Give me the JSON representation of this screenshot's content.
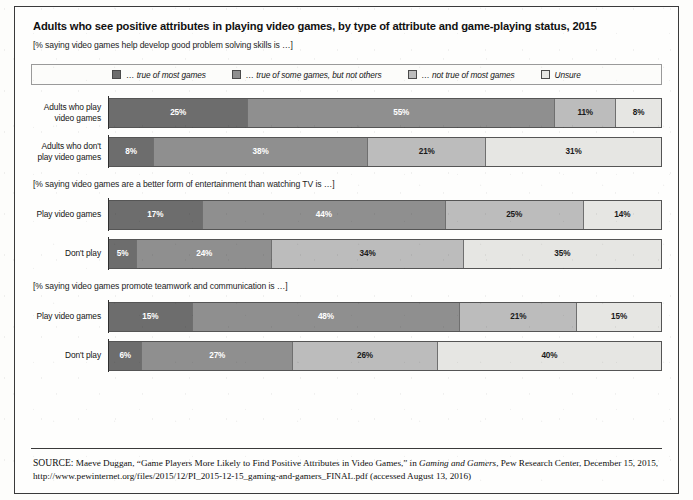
{
  "title": "Adults who see positive attributes in playing video games, by type of attribute and game-playing status, 2015",
  "subtitle": "[% saying video games help develop good problem solving skills is …]",
  "palette": {
    "true_of_most": "#6d6d6d",
    "true_of_some": "#8f8f8f",
    "not_true_of_most": "#bcbcbc",
    "unsure": "#e6e6e3",
    "frame": "#3a3a3a"
  },
  "legend": {
    "items": [
      {
        "label": "… true of most games",
        "color": "#6d6d6d"
      },
      {
        "label": "… true of some games, but not others",
        "color": "#8f8f8f"
      },
      {
        "label": "… not true of most games",
        "color": "#bcbcbc"
      },
      {
        "label": "Unsure",
        "color": "#e6e6e3"
      }
    ]
  },
  "sections": [
    {
      "note": "",
      "note_visible": false,
      "rows": [
        {
          "label_line1": "Adults who play",
          "label_line2": "video games",
          "segments": [
            {
              "value": 25,
              "label": "25%",
              "color": "#6d6d6d",
              "text_color": "#ffffff"
            },
            {
              "value": 55,
              "label": "55%",
              "color": "#8f8f8f",
              "text_color": "#ffffff"
            },
            {
              "value": 11,
              "label": "11%",
              "color": "#bcbcbc",
              "text_color": "#1a1a1a"
            },
            {
              "value": 8,
              "label": "8%",
              "color": "#e6e6e3",
              "text_color": "#1a1a1a"
            }
          ]
        },
        {
          "label_line1": "Adults who don't",
          "label_line2": "play video games",
          "segments": [
            {
              "value": 8,
              "label": "8%",
              "color": "#6d6d6d",
              "text_color": "#ffffff"
            },
            {
              "value": 38,
              "label": "38%",
              "color": "#8f8f8f",
              "text_color": "#ffffff"
            },
            {
              "value": 21,
              "label": "21%",
              "color": "#bcbcbc",
              "text_color": "#1a1a1a"
            },
            {
              "value": 31,
              "label": "31%",
              "color": "#e6e6e3",
              "text_color": "#1a1a1a"
            }
          ]
        }
      ]
    },
    {
      "note": "[% saying video games are a better form of entertainment than watching TV is …]",
      "note_visible": true,
      "rows": [
        {
          "label_line1": "Play video games",
          "label_line2": "",
          "segments": [
            {
              "value": 17,
              "label": "17%",
              "color": "#6d6d6d",
              "text_color": "#ffffff"
            },
            {
              "value": 44,
              "label": "44%",
              "color": "#8f8f8f",
              "text_color": "#ffffff"
            },
            {
              "value": 25,
              "label": "25%",
              "color": "#bcbcbc",
              "text_color": "#1a1a1a"
            },
            {
              "value": 14,
              "label": "14%",
              "color": "#e6e6e3",
              "text_color": "#1a1a1a"
            }
          ]
        },
        {
          "label_line1": "Don't play",
          "label_line2": "",
          "segments": [
            {
              "value": 5,
              "label": "5%",
              "color": "#6d6d6d",
              "text_color": "#ffffff"
            },
            {
              "value": 24,
              "label": "24%",
              "color": "#8f8f8f",
              "text_color": "#ffffff"
            },
            {
              "value": 34,
              "label": "34%",
              "color": "#bcbcbc",
              "text_color": "#1a1a1a"
            },
            {
              "value": 35,
              "label": "35%",
              "color": "#e6e6e3",
              "text_color": "#1a1a1a"
            }
          ]
        }
      ]
    },
    {
      "note": "[% saying video games promote teamwork and communication is …]",
      "note_visible": true,
      "rows": [
        {
          "label_line1": "Play video games",
          "label_line2": "",
          "segments": [
            {
              "value": 15,
              "label": "15%",
              "color": "#6d6d6d",
              "text_color": "#ffffff"
            },
            {
              "value": 48,
              "label": "48%",
              "color": "#8f8f8f",
              "text_color": "#ffffff"
            },
            {
              "value": 21,
              "label": "21%",
              "color": "#bcbcbc",
              "text_color": "#1a1a1a"
            },
            {
              "value": 15,
              "label": "15%",
              "color": "#e6e6e3",
              "text_color": "#1a1a1a"
            }
          ]
        },
        {
          "label_line1": "Don't play",
          "label_line2": "",
          "segments": [
            {
              "value": 6,
              "label": "6%",
              "color": "#6d6d6d",
              "text_color": "#ffffff"
            },
            {
              "value": 27,
              "label": "27%",
              "color": "#8f8f8f",
              "text_color": "#ffffff"
            },
            {
              "value": 26,
              "label": "26%",
              "color": "#bcbcbc",
              "text_color": "#1a1a1a"
            },
            {
              "value": 40,
              "label": "40%",
              "color": "#e6e6e3",
              "text_color": "#1a1a1a"
            }
          ]
        }
      ]
    }
  ],
  "source": {
    "prefix": "SOURCE:",
    "part1": " Maeve Duggan, “Game Players More Likely to Find Positive Attributes in Video Games,” in ",
    "italic1": "Gaming and Gamers",
    "part2": ", Pew Research Center, December 15, 2015, http://www.pewinternet.org/files/2015/12/PI_2015-12-15_gaming-and-gamers_FINAL.pdf (accessed August 13, 2016)"
  },
  "chart_data": {
    "type": "bar",
    "title": "Adults who see positive attributes in playing video games, by type of attribute and game-playing status, 2015",
    "subtitle": "[% saying video games help develop good problem solving skills is …]",
    "orientation": "horizontal",
    "stacked": true,
    "stack_total": 100,
    "xlabel": "",
    "ylabel": "",
    "xlim": [
      0,
      100
    ],
    "grid": false,
    "legend_position": "top",
    "legend": [
      "… true of most games",
      "… true of some games, but not others",
      "… not true of most games",
      "Unsure"
    ],
    "panels": [
      {
        "panel_title": "[% saying video games help develop good problem solving skills is …]",
        "categories": [
          "Adults who play video games",
          "Adults who don't play video games"
        ],
        "series": [
          {
            "name": "… true of most games",
            "values": [
              25,
              8
            ]
          },
          {
            "name": "… true of some games, but not others",
            "values": [
              55,
              38
            ]
          },
          {
            "name": "… not true of most games",
            "values": [
              11,
              21
            ]
          },
          {
            "name": "Unsure",
            "values": [
              8,
              31
            ]
          }
        ]
      },
      {
        "panel_title": "[% saying video games are a better form of entertainment than watching TV is …]",
        "categories": [
          "Play video games",
          "Don't play"
        ],
        "series": [
          {
            "name": "… true of most games",
            "values": [
              17,
              5
            ]
          },
          {
            "name": "… true of some games, but not others",
            "values": [
              44,
              24
            ]
          },
          {
            "name": "… not true of most games",
            "values": [
              25,
              34
            ]
          },
          {
            "name": "Unsure",
            "values": [
              14,
              35
            ]
          }
        ]
      },
      {
        "panel_title": "[% saying video games promote teamwork and communication is …]",
        "categories": [
          "Play video games",
          "Don't play"
        ],
        "series": [
          {
            "name": "… true of most games",
            "values": [
              15,
              6
            ]
          },
          {
            "name": "… true of some games, but not others",
            "values": [
              48,
              27
            ]
          },
          {
            "name": "… not true of most games",
            "values": [
              21,
              26
            ]
          },
          {
            "name": "Unsure",
            "values": [
              15,
              40
            ]
          }
        ]
      }
    ],
    "source": "SOURCE: Maeve Duggan, “Game Players More Likely to Find Positive Attributes in Video Games,” in Gaming and Gamers, Pew Research Center, December 15, 2015, http://www.pewinternet.org/files/2015/12/PI_2015-12-15_gaming-and-gamers_FINAL.pdf (accessed August 13, 2016)"
  }
}
